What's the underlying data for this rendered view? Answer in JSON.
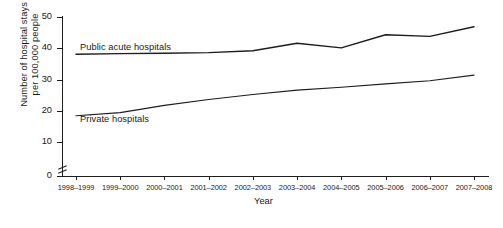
{
  "chart_data": {
    "type": "line",
    "title": "",
    "xlabel": "Year",
    "ylabel_line1": "Number of hospital stays",
    "ylabel_line2": "per 100,000 people",
    "categories": [
      "1998–1999",
      "1999–2000",
      "2000–2001",
      "2001–2002",
      "2002–2003",
      "2003–2004",
      "2004–2005",
      "2005–2006",
      "2006–2007",
      "2007–2008"
    ],
    "yticks": [
      0,
      10,
      20,
      30,
      40,
      50
    ],
    "ylim": [
      10,
      50
    ],
    "y_axis_break": true,
    "grid": false,
    "legend": "inline-series-labels",
    "series": [
      {
        "name": "Public acute hospitals",
        "values": [
          38.1,
          38.3,
          38.4,
          38.6,
          39.2,
          41.6,
          40.1,
          44.3,
          43.8,
          46.9
        ]
      },
      {
        "name": "Private hospitals",
        "values": [
          18.4,
          19.4,
          21.7,
          23.6,
          25.2,
          26.6,
          27.5,
          28.6,
          29.6,
          31.4
        ]
      }
    ],
    "series_colors": [
      "#1d1d1d",
      "#1d1d1d"
    ]
  },
  "axis": {
    "tick_labels_y": [
      "50",
      "40",
      "30",
      "20",
      "10",
      "0"
    ],
    "x_title": "Year"
  }
}
